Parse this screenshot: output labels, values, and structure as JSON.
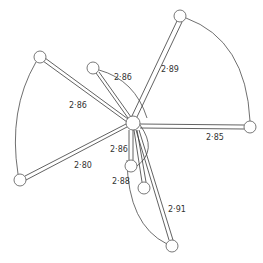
{
  "diagram": {
    "center": {
      "x": 133,
      "y": 123,
      "r": 7
    },
    "atoms": [
      {
        "id": "top-right",
        "x": 180,
        "y": 16,
        "r": 6
      },
      {
        "id": "right",
        "x": 250,
        "y": 127,
        "r": 6
      },
      {
        "id": "upper-left",
        "x": 40,
        "y": 57,
        "r": 6
      },
      {
        "id": "lower-left",
        "x": 20,
        "y": 180,
        "r": 6
      },
      {
        "id": "inner-upper",
        "x": 93,
        "y": 68,
        "r": 6
      },
      {
        "id": "inner-lower-a",
        "x": 131,
        "y": 166,
        "r": 6
      },
      {
        "id": "inner-lower-b",
        "x": 144,
        "y": 188,
        "r": 6
      },
      {
        "id": "bottom",
        "x": 172,
        "y": 246,
        "r": 6
      }
    ],
    "labels": [
      {
        "text": "2·89",
        "x": 161,
        "y": 72
      },
      {
        "text": "2·86",
        "x": 114,
        "y": 80
      },
      {
        "text": "2·86",
        "x": 69,
        "y": 108
      },
      {
        "text": "2·85",
        "x": 206,
        "y": 140
      },
      {
        "text": "2·80",
        "x": 74,
        "y": 168
      },
      {
        "text": "2·86",
        "x": 110,
        "y": 152
      },
      {
        "text": "2·88",
        "x": 112,
        "y": 184
      },
      {
        "text": "2·91",
        "x": 168,
        "y": 212
      }
    ]
  }
}
